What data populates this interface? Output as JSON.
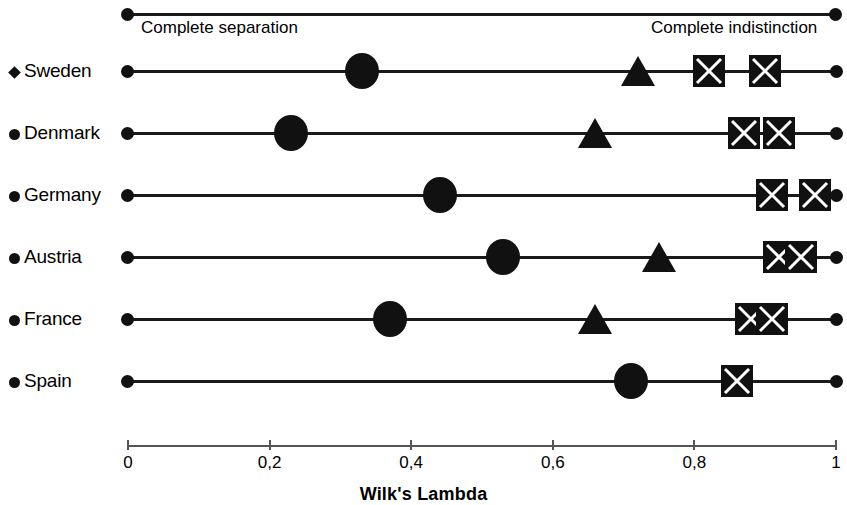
{
  "chart_data": {
    "type": "scatter",
    "title": "",
    "xlabel": "Wilk's Lambda",
    "ylabel": "",
    "xlim": [
      0,
      1
    ],
    "xticks": [
      "0",
      "0,2",
      "0,4",
      "0,6",
      "0,8",
      "1"
    ],
    "xtick_values": [
      0,
      0.2,
      0.4,
      0.6,
      0.8,
      1
    ],
    "grid": false,
    "legend_position": "left-row-labels",
    "annotations": [
      {
        "text": "Complete separation",
        "x": 0.02
      },
      {
        "text": "Complete indistinction",
        "x": 0.74
      }
    ],
    "categories": [
      "Sweden",
      "Denmark",
      "Germany",
      "Austria",
      "France",
      "Spain"
    ],
    "series": [
      {
        "name": "circle",
        "marker": "circle",
        "values": [
          0.33,
          0.23,
          0.44,
          0.53,
          0.37,
          0.71
        ]
      },
      {
        "name": "triangle",
        "marker": "triangle",
        "values": [
          0.72,
          0.66,
          null,
          0.75,
          0.66,
          null
        ]
      },
      {
        "name": "square-a",
        "marker": "square",
        "values": [
          0.82,
          0.87,
          0.91,
          0.92,
          0.88,
          0.86
        ]
      },
      {
        "name": "square-b",
        "marker": "square",
        "values": [
          0.9,
          0.92,
          0.97,
          0.95,
          0.91,
          null
        ]
      }
    ],
    "rows": [
      {
        "label": "Sweden",
        "glyph": "diamond",
        "markers": [
          {
            "type": "circle",
            "value": 0.33
          },
          {
            "type": "triangle",
            "value": 0.72
          },
          {
            "type": "square",
            "value": 0.82
          },
          {
            "type": "square",
            "value": 0.9
          }
        ]
      },
      {
        "label": "Denmark",
        "glyph": "dot",
        "markers": [
          {
            "type": "circle",
            "value": 0.23
          },
          {
            "type": "triangle",
            "value": 0.66
          },
          {
            "type": "square",
            "value": 0.87
          },
          {
            "type": "square",
            "value": 0.92
          }
        ]
      },
      {
        "label": "Germany",
        "glyph": "dot",
        "markers": [
          {
            "type": "circle",
            "value": 0.44
          },
          {
            "type": "square",
            "value": 0.91
          },
          {
            "type": "square",
            "value": 0.97
          }
        ]
      },
      {
        "label": "Austria",
        "glyph": "dot",
        "markers": [
          {
            "type": "circle",
            "value": 0.53
          },
          {
            "type": "triangle",
            "value": 0.75
          },
          {
            "type": "square",
            "value": 0.92
          },
          {
            "type": "square",
            "value": 0.95
          }
        ]
      },
      {
        "label": "France",
        "glyph": "dot",
        "markers": [
          {
            "type": "circle",
            "value": 0.37
          },
          {
            "type": "triangle",
            "value": 0.66
          },
          {
            "type": "square",
            "value": 0.88
          },
          {
            "type": "square",
            "value": 0.91
          }
        ]
      },
      {
        "label": "Spain",
        "glyph": "dot",
        "markers": [
          {
            "type": "circle",
            "value": 0.71
          },
          {
            "type": "square",
            "value": 0.86
          }
        ]
      }
    ]
  },
  "reference": {
    "left_caption": "Complete separation",
    "right_caption": "Complete indistinction"
  },
  "axis": {
    "title": "Wilk's Lambda",
    "ticks": [
      "0",
      "0,2",
      "0,4",
      "0,6",
      "0,8",
      "1"
    ]
  },
  "colors": {
    "marker": "#111111",
    "line": "#1a1a1a",
    "axis": "#555555",
    "background": "#ffffff"
  }
}
